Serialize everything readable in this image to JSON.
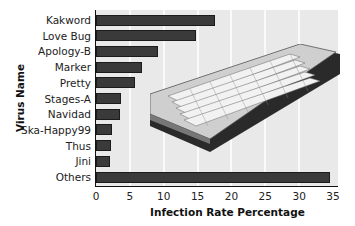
{
  "chart_data": {
    "type": "bar",
    "orientation": "horizontal",
    "title": "",
    "xlabel": "Infection Rate Percentage",
    "ylabel": "Virus Name",
    "categories": [
      "Kakword",
      "Love Bug",
      "Apology-B",
      "Marker",
      "Pretty",
      "Stages-A",
      "Navidad",
      "Ska-Happy99",
      "Thus",
      "Jini",
      "Others"
    ],
    "values": [
      17.6,
      14.8,
      9.2,
      6.8,
      5.8,
      3.7,
      3.5,
      2.4,
      2.2,
      2.1,
      34.5
    ],
    "xlim": [
      0,
      35
    ],
    "xticks": [
      "0",
      "5",
      "10",
      "15",
      "20",
      "25",
      "30",
      "35"
    ],
    "grid": true,
    "legend": null,
    "decoration": "computer keyboard illustration overlaid on plot"
  }
}
